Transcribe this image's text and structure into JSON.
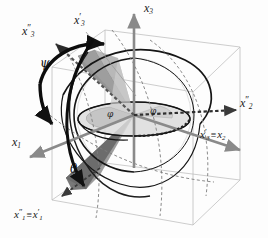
{
  "figure": {
    "background": "#fdfdfd"
  },
  "colors": {
    "axis_gray": "#8a8a8a",
    "axis_dark": "#2b2b2b",
    "cube_edge": "#b4b4b4",
    "sphere_line": "#1c1c1c",
    "shade_dark": "#777777",
    "shade_mid": "#9b9b9b",
    "shade_light": "#c9c9c9",
    "shade_pale": "#dcdcdc",
    "dotted": "#3a3a3a",
    "text": "#1a1a1a"
  },
  "axes": [
    {
      "id": "x3",
      "base": "x",
      "sub": "3",
      "prime": "",
      "equals": "",
      "label": "x3"
    },
    {
      "id": "x3pp",
      "base": "x",
      "sub": "3",
      "prime": "″",
      "equals": "",
      "label": "x3''"
    },
    {
      "id": "x3p",
      "base": "x",
      "sub": "3",
      "prime": "′",
      "equals": "",
      "label": "x3'"
    },
    {
      "id": "x2pp",
      "base": "x",
      "sub": "2",
      "prime": "″",
      "equals": "",
      "label": "x2''"
    },
    {
      "id": "x3p_x2",
      "base": "x",
      "sub": "3",
      "prime": "′",
      "equals": "≡",
      "eq_base": "x",
      "eq_sub": "2",
      "label": "x3'=x2"
    },
    {
      "id": "x1",
      "base": "x",
      "sub": "1",
      "prime": "",
      "equals": "",
      "label": "x1"
    },
    {
      "id": "x1pp_x1p",
      "base": "x",
      "sub": "1",
      "prime": "″",
      "equals": "≡",
      "eq_base": "x",
      "eq_sub": "1",
      "eq_prime": "′",
      "label": "x1''=x1'"
    }
  ],
  "angles": [
    {
      "id": "psi",
      "symbol": "ψ",
      "name": "psi"
    },
    {
      "id": "theta",
      "symbol": "θ",
      "name": "theta"
    },
    {
      "id": "phi1",
      "symbol": "φ",
      "name": "phi"
    },
    {
      "id": "phi2",
      "symbol": "φ",
      "name": "phi"
    }
  ]
}
